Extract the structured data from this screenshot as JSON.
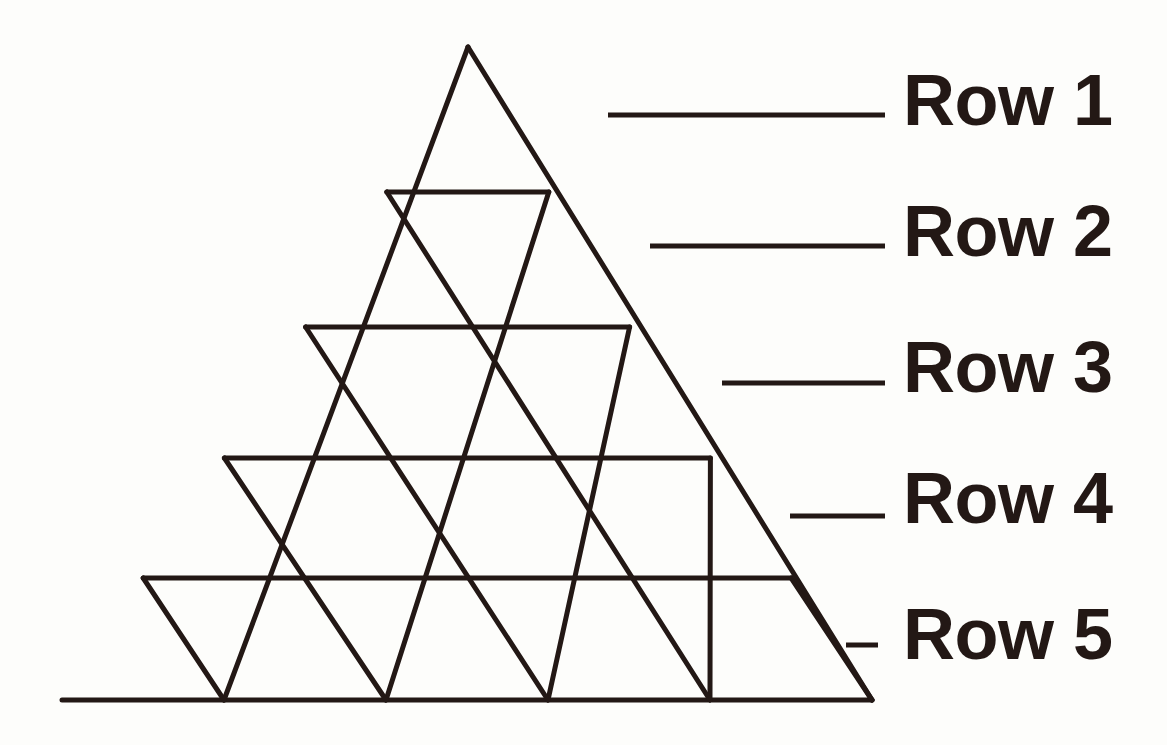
{
  "canvas": {
    "width": 1167,
    "height": 745,
    "background_color": "#fdfdfb",
    "ink_color": "#231815"
  },
  "figure": {
    "name": "triangular-grid-of-order-5",
    "apex": {
      "x": 468,
      "y": 47
    },
    "bottom_left": {
      "x": 62,
      "y": 700
    },
    "bottom_right": {
      "x": 872,
      "y": 700
    },
    "rows": 5,
    "row_boundaries_y": [
      47,
      192,
      327,
      458,
      578,
      700
    ],
    "small_triangles_per_row": [
      1,
      3,
      5,
      7,
      9
    ],
    "total_small_triangles": 25,
    "stroke_width": 5
  },
  "legend": {
    "leader_line_end_x": 885,
    "label_left_x": 903,
    "items": [
      {
        "label": "Row 1",
        "leader_y": 115,
        "leader_x1": 608,
        "leader_x2": 885,
        "text_center_y": 100,
        "triangles_in_row": 1
      },
      {
        "label": "Row 2",
        "leader_y": 246,
        "leader_x1": 650,
        "leader_x2": 885,
        "text_center_y": 231,
        "triangles_in_row": 3
      },
      {
        "label": "Row 3",
        "leader_y": 383,
        "leader_x1": 722,
        "leader_x2": 885,
        "text_center_y": 367,
        "triangles_in_row": 5
      },
      {
        "label": "Row 4",
        "leader_y": 516,
        "leader_x1": 790,
        "leader_x2": 885,
        "text_center_y": 498,
        "triangles_in_row": 7
      },
      {
        "label": "Row 5",
        "leader_y": 645,
        "leader_x1": 846,
        "leader_x2": 878,
        "text_center_y": 634,
        "triangles_in_row": 9
      }
    ]
  }
}
